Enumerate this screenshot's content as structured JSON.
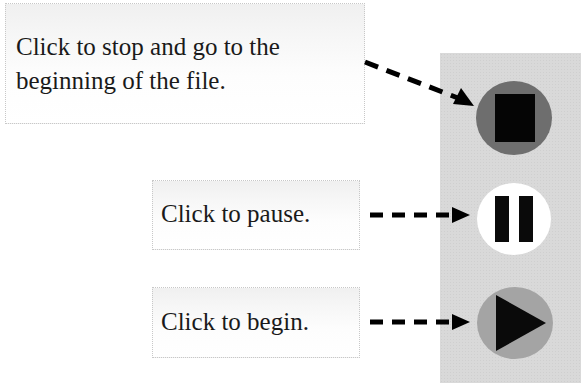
{
  "callouts": {
    "stop": {
      "line1": "Click to stop and go to the",
      "line2": "beginning of the file."
    },
    "pause": {
      "text": "Click to pause."
    },
    "begin": {
      "text": "Click to begin."
    }
  },
  "controls": [
    {
      "name": "stop",
      "icon": "stop-icon",
      "circle_color": "#6e6e6e"
    },
    {
      "name": "pause",
      "icon": "pause-icon",
      "circle_color": "#ffffff"
    },
    {
      "name": "play",
      "icon": "play-icon",
      "circle_color": "#a4a4a4"
    }
  ],
  "colors": {
    "panel": "#d9d9d9",
    "arrow": "#000000"
  }
}
